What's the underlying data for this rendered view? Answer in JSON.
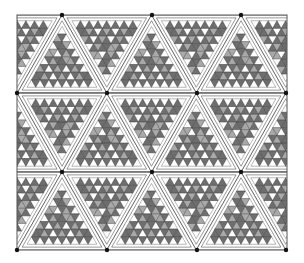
{
  "figure": {
    "frame": {
      "x0": 17,
      "y0": 15,
      "x1": 287,
      "y1": 250
    },
    "row_lines_y": [
      93,
      172
    ],
    "vertex_rows_y": [
      15,
      93,
      172,
      250
    ],
    "side": 89.5,
    "subdivisions": 8,
    "colors": {
      "background": "#ffffff",
      "stroke": "#333333",
      "dark": "#6e6e6e",
      "mid": "#a9a9a9",
      "light": "#ffffff",
      "band": "#ffffff",
      "hub": "#111111"
    }
  }
}
